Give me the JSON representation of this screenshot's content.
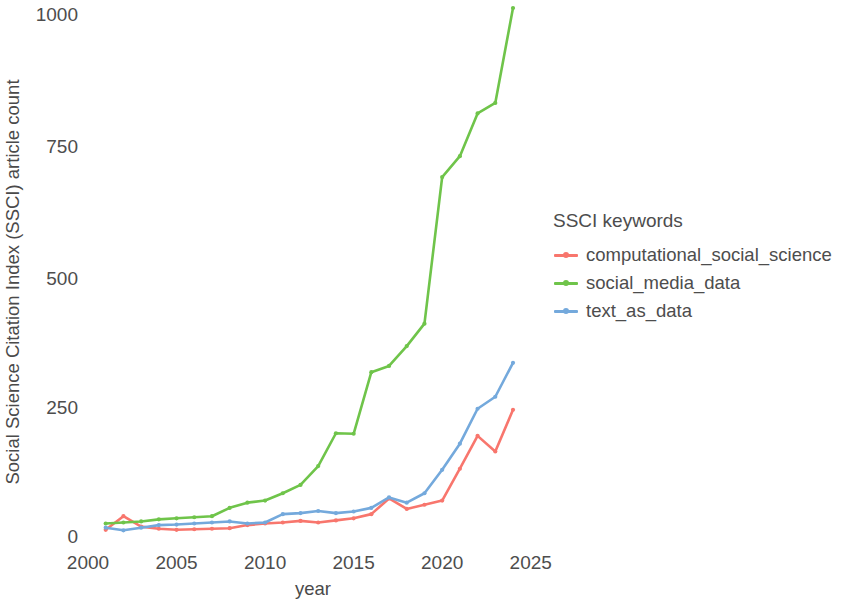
{
  "chart_data": {
    "type": "line",
    "title": "",
    "xlabel": "year",
    "ylabel": "Social Science Citation Index (SSCI) article count",
    "xlim": [
      1999,
      2026
    ],
    "ylim": [
      0,
      1030
    ],
    "xticks": [
      "2000",
      "2005",
      "2010",
      "2015",
      "2020",
      "2025"
    ],
    "xtick_values": [
      2000,
      2005,
      2010,
      2015,
      2020,
      2025
    ],
    "yticks": [
      "0",
      "250",
      "500",
      "750",
      "1000"
    ],
    "ytick_values": [
      0,
      250,
      500,
      750,
      1000
    ],
    "grid": false,
    "legend_position": "right",
    "legend_title": "SSCI keywords",
    "x": [
      2001,
      2002,
      2003,
      2004,
      2005,
      2006,
      2007,
      2008,
      2009,
      2010,
      2011,
      2012,
      2013,
      2014,
      2015,
      2016,
      2017,
      2018,
      2019,
      2020,
      2021,
      2022,
      2023,
      2024
    ],
    "series": [
      {
        "name": "computational_social_science",
        "color": "#F8766D",
        "values": [
          10,
          36,
          16,
          12,
          10,
          11,
          12,
          13,
          19,
          22,
          24,
          27,
          24,
          28,
          32,
          40,
          70,
          50,
          58,
          66,
          127,
          190,
          160,
          240
        ]
      },
      {
        "name": "social_media_data",
        "color": "#6FC44A",
        "values": [
          22,
          24,
          26,
          30,
          32,
          34,
          36,
          52,
          62,
          66,
          80,
          96,
          132,
          195,
          194,
          312,
          324,
          362,
          405,
          686,
          726,
          808,
          828,
          1010
        ]
      },
      {
        "name": "text_as_data",
        "color": "#74A9DC",
        "values": [
          14,
          9,
          14,
          19,
          20,
          22,
          24,
          26,
          22,
          24,
          40,
          42,
          46,
          42,
          45,
          52,
          72,
          62,
          80,
          125,
          175,
          242,
          265,
          330
        ]
      }
    ]
  },
  "axis": {
    "y_title": "Social Science Citation Index (SSCI) article count",
    "x_title": "year"
  },
  "legend": {
    "title": "SSCI keywords",
    "items": [
      {
        "label": "computational_social_science",
        "color": "#F8766D"
      },
      {
        "label": "social_media_data",
        "color": "#6FC44A"
      },
      {
        "label": "text_as_data",
        "color": "#74A9DC"
      }
    ]
  }
}
